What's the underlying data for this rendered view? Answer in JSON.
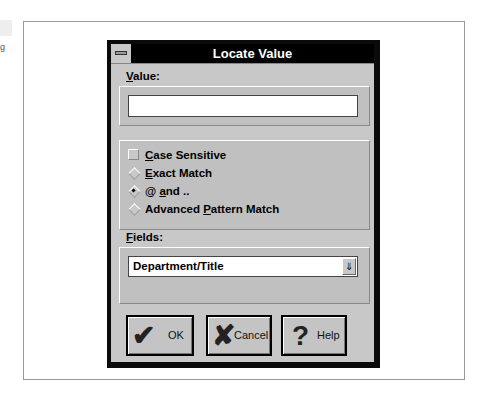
{
  "background": {
    "partial_text": "g"
  },
  "dialog": {
    "title": "Locate Value",
    "value_label": "Value:",
    "value_input": "",
    "options": [
      {
        "type": "checkbox",
        "label": "Case Sensitive",
        "checked": false
      },
      {
        "type": "radio",
        "label": "Exact Match",
        "checked": false
      },
      {
        "type": "radio",
        "label": "@ and ..",
        "checked": true
      },
      {
        "type": "radio",
        "label": "Advanced Pattern Match",
        "checked": false
      }
    ],
    "fields_label": "Fields:",
    "fields_selected": "Department/Title",
    "dropdown_arrow": "⇓",
    "buttons": {
      "ok": {
        "label": "OK",
        "icon": "✔"
      },
      "cancel": {
        "label": "Cancel",
        "icon": "✘"
      },
      "help": {
        "label": "Help",
        "icon": "?"
      }
    }
  }
}
